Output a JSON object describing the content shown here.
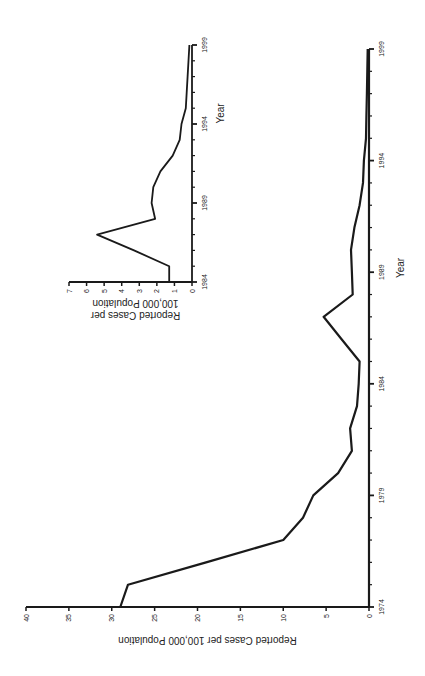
{
  "chart_data": [
    {
      "id": "main",
      "type": "line",
      "title": "",
      "xlabel": "Year",
      "ylabel": "Reported Cases per 100,000 Population",
      "x_ticks": [
        1974,
        1979,
        1984,
        1989,
        1994,
        1999
      ],
      "y_ticks": [
        0,
        5,
        10,
        15,
        20,
        25,
        30,
        35,
        40
      ],
      "xlim": [
        1974,
        1999
      ],
      "ylim": [
        0,
        40
      ],
      "grid": false,
      "legend": null,
      "orientation": "rotated 90 degrees counter-clockwise on page",
      "x": [
        1974,
        1975,
        1976,
        1977,
        1978,
        1979,
        1980,
        1981,
        1982,
        1983,
        1984,
        1985,
        1986,
        1987,
        1988,
        1989,
        1990,
        1991,
        1992,
        1993,
        1994,
        1995,
        1996,
        1997,
        1998,
        1999
      ],
      "series": [
        {
          "name": "Reported cases",
          "values": [
            29.0,
            28.1,
            19.0,
            10.0,
            7.7,
            6.5,
            3.6,
            2.0,
            2.2,
            1.4,
            1.2,
            1.1,
            3.2,
            5.3,
            1.9,
            2.0,
            2.1,
            1.7,
            1.1,
            0.7,
            0.6,
            0.35,
            0.3,
            0.25,
            0.2,
            0.15
          ]
        }
      ]
    },
    {
      "id": "inset",
      "type": "line",
      "title": "",
      "xlabel": "Year",
      "ylabel": "Reported Cases per 100,000 Population",
      "x_ticks": [
        1984,
        1989,
        1994,
        1999
      ],
      "y_ticks": [
        0,
        1,
        2,
        3,
        4,
        5,
        6,
        7
      ],
      "xlim": [
        1984,
        1999
      ],
      "ylim": [
        0,
        7
      ],
      "grid": false,
      "legend": null,
      "x": [
        1984,
        1985,
        1986,
        1987,
        1988,
        1989,
        1990,
        1991,
        1992,
        1993,
        1994,
        1995,
        1996,
        1997,
        1998,
        1999
      ],
      "series": [
        {
          "name": "Reported cases",
          "values": [
            1.3,
            1.3,
            3.3,
            5.4,
            2.1,
            2.3,
            2.2,
            1.8,
            1.1,
            0.7,
            0.6,
            0.35,
            0.3,
            0.25,
            0.2,
            0.15
          ]
        }
      ]
    }
  ],
  "labels": {
    "main_xlabel": "Year",
    "main_ylabel": "Reported Cases per 100,000 Population",
    "inset_xlabel": "Year",
    "inset_ylabel_line1": "Reported Cases per",
    "inset_ylabel_line2": "100,000 Population"
  },
  "colors": {
    "line": "#1a1a1a",
    "axis": "#1a1a1a",
    "background": "#ffffff"
  }
}
